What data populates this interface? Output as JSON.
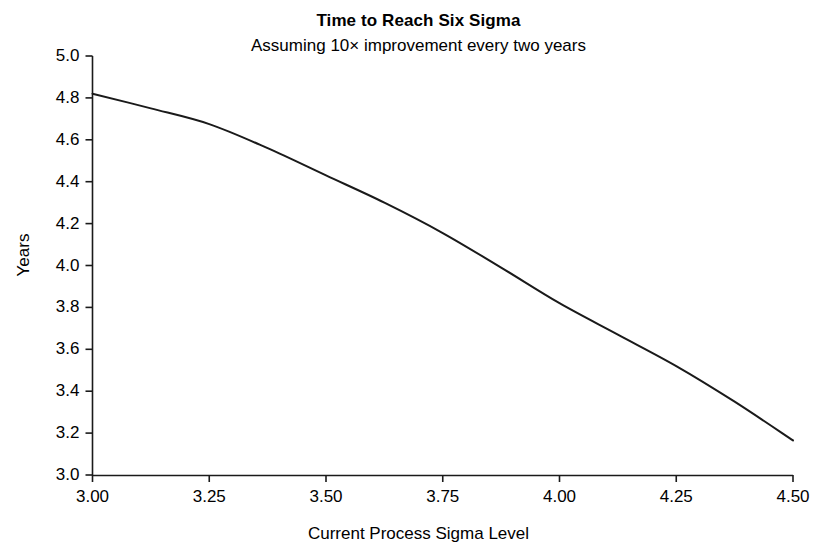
{
  "chart_data": {
    "type": "line",
    "title": "Time to Reach Six Sigma",
    "subtitle": "Assuming 10× improvement every two years",
    "xlabel": "Current Process Sigma Level",
    "ylabel": "Years",
    "xlim": [
      3.0,
      4.5
    ],
    "ylim": [
      3.0,
      5.0
    ],
    "xticks": [
      "3.00",
      "3.25",
      "3.50",
      "3.75",
      "4.00",
      "4.25",
      "4.50"
    ],
    "xtick_values": [
      3.0,
      3.25,
      3.5,
      3.75,
      4.0,
      4.25,
      4.5
    ],
    "yticks": [
      "3.0",
      "3.2",
      "3.4",
      "3.6",
      "3.8",
      "4.0",
      "4.2",
      "4.4",
      "4.6",
      "4.8",
      "5.0"
    ],
    "ytick_values": [
      3.0,
      3.2,
      3.4,
      3.6,
      3.8,
      4.0,
      4.2,
      4.4,
      4.6,
      4.8,
      5.0
    ],
    "grid": false,
    "legend": "none",
    "line_color": "#1a1a1a",
    "line_width": 2,
    "x": [
      3.0,
      3.125,
      3.25,
      3.375,
      3.5,
      3.625,
      3.75,
      3.875,
      4.0,
      4.125,
      4.25,
      4.375,
      4.5
    ],
    "y": [
      4.82,
      4.75,
      4.675,
      4.56,
      4.43,
      4.3,
      4.155,
      3.99,
      3.82,
      3.67,
      3.52,
      3.35,
      3.165
    ],
    "series": [
      {
        "name": "Time to Reach Six Sigma",
        "values": [
          4.82,
          4.75,
          4.675,
          4.56,
          4.43,
          4.3,
          4.155,
          3.99,
          3.82,
          3.67,
          3.52,
          3.35,
          3.165
        ]
      }
    ]
  }
}
